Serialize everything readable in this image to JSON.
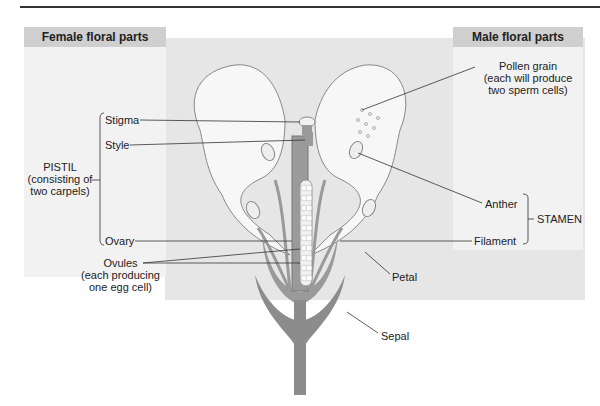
{
  "female_panel": {
    "title": "Female floral parts"
  },
  "male_panel": {
    "title": "Male floral parts"
  },
  "labels": {
    "stigma": "Stigma",
    "style": "Style",
    "pistil_title": "PISTIL",
    "pistil_line2": "(consisting of",
    "pistil_line3": "two carpels)",
    "ovary": "Ovary",
    "ovules": "Ovules",
    "ovules_line2": "(each producing",
    "ovules_line3": "one egg cell)",
    "pollen": "Pollen grain",
    "pollen_line2": "(each will produce",
    "pollen_line3": "two sperm cells)",
    "anther": "Anther",
    "filament": "Filament",
    "stamen": "STAMEN",
    "petal": "Petal",
    "sepal": "Sepal"
  },
  "colors": {
    "panel_header": "#cfcfcf",
    "panel_bg": "#f2f2f2",
    "center_bg": "#e6e6e6",
    "tissue": "#8c8c8c",
    "petal_fill": "#f7f7f7"
  }
}
